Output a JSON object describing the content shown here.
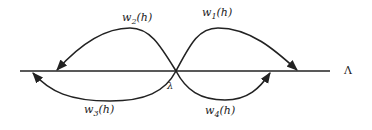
{
  "diagram": {
    "axis_label": "Λ",
    "crossing_label": "λ",
    "curves": [
      {
        "name": "w",
        "sub": "1",
        "arg": "(h)",
        "direction": "top-right loop, arrow toward right on axis"
      },
      {
        "name": "w",
        "sub": "2",
        "arg": "(h)",
        "direction": "top-left loop, arrow toward left on axis"
      },
      {
        "name": "w",
        "sub": "3",
        "arg": "(h)",
        "direction": "bottom-left loop, arrow toward far left on axis"
      },
      {
        "name": "w",
        "sub": "4",
        "arg": "(h)",
        "direction": "bottom-right loop, arrow toward right on axis"
      }
    ],
    "colors": {
      "stroke": "#222222",
      "background": "#ffffff"
    }
  }
}
